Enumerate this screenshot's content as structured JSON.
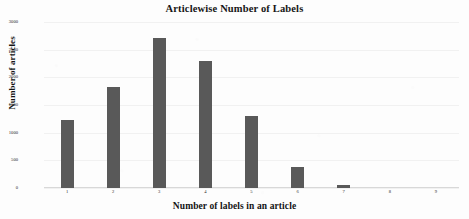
{
  "chart_data": {
    "type": "bar",
    "title": "Articlewise Number of Labels",
    "xlabel": "Number of labels in an article",
    "ylabel": "Number of articles",
    "categories": [
      "1",
      "2",
      "3",
      "4",
      "5",
      "6",
      "7",
      "8",
      "9"
    ],
    "values": [
      1235,
      1830,
      2720,
      2300,
      1310,
      380,
      60,
      5,
      2
    ],
    "ylim": [
      0,
      3000
    ],
    "ytick_labels": [
      "0",
      "500",
      "1000",
      "1500",
      "2000",
      "2500",
      "3000"
    ],
    "ytick_values": [
      0,
      500,
      1000,
      1500,
      2000,
      2500,
      3000
    ],
    "grid": true,
    "legend": null,
    "bar_color": "#595959",
    "background_color": "#fdfdfd",
    "gridline_color": "#f1f1f1"
  }
}
